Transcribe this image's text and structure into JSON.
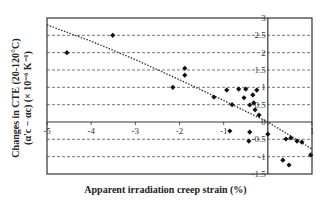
{
  "chart_data": {
    "type": "scatter",
    "title": "",
    "xlabel": "Apparent irradiation creep strain (%)",
    "ylabel": "Changes in CTE (20-120°C)",
    "ylabel_line2": "(α'c − αc) (× 10⁻⁶ K⁻¹)",
    "xlim": [
      -5,
      1
    ],
    "ylim": [
      -1.5,
      3
    ],
    "x_ticks": [
      -5,
      -4,
      -3,
      -2,
      -1,
      0,
      1
    ],
    "x_tick_labels": [
      "-5",
      "-4",
      "-3",
      "-2",
      "-1",
      "",
      "1"
    ],
    "y_ticks": [
      3,
      2.5,
      2,
      1.5,
      1,
      0.5,
      0,
      -0.5,
      -1,
      -1.5
    ],
    "y_tick_labels": [
      "3",
      "2.5",
      "2",
      "1.5",
      "1",
      "0.5",
      "0",
      "-0.5",
      "-1",
      "-1.5"
    ],
    "grid": "horizontal dashed",
    "legend": "none",
    "series": [
      {
        "name": "data",
        "marker": "diamond",
        "points": [
          [
            -4.55,
            2.0
          ],
          [
            -3.51,
            2.5
          ],
          [
            -2.15,
            1.0
          ],
          [
            -1.88,
            1.55
          ],
          [
            -1.88,
            1.35
          ],
          [
            -1.22,
            0.72
          ],
          [
            -0.93,
            0.92
          ],
          [
            -0.81,
            0.5
          ],
          [
            -0.66,
            0.95
          ],
          [
            -0.5,
            0.95
          ],
          [
            -0.54,
            0.7
          ],
          [
            -0.34,
            0.78
          ],
          [
            -0.25,
            0.92
          ],
          [
            -0.41,
            0.49
          ],
          [
            -0.32,
            0.55
          ],
          [
            -0.29,
            0.35
          ],
          [
            -0.2,
            0.2
          ],
          [
            -0.86,
            -0.26
          ],
          [
            -0.41,
            -0.29
          ],
          [
            -0.43,
            -0.55
          ],
          [
            0.0,
            -0.35
          ],
          [
            0.41,
            -0.49
          ],
          [
            0.52,
            -0.46
          ],
          [
            0.66,
            -0.55
          ],
          [
            0.77,
            -0.58
          ],
          [
            0.97,
            -0.95
          ],
          [
            0.34,
            -1.1
          ],
          [
            0.48,
            -1.24
          ]
        ]
      }
    ],
    "trendline": {
      "style": "dotted",
      "points": [
        [
          -5,
          2.8
        ],
        [
          -4,
          2.33
        ],
        [
          -3,
          1.8
        ],
        [
          -2,
          1.22
        ],
        [
          -1,
          0.62
        ],
        [
          0,
          0.0
        ],
        [
          1,
          -0.78
        ]
      ]
    }
  }
}
